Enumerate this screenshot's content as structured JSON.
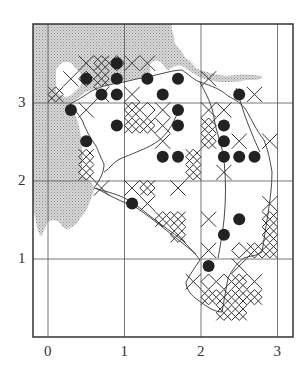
{
  "figure": {
    "type": "distribution-grid-map",
    "frame": {
      "left": 33,
      "top": 24,
      "right": 293,
      "bottom": 337
    },
    "unit_px": {
      "x": 76.5,
      "y": 78
    },
    "origin_px": {
      "x": 48,
      "y": 337
    },
    "subgrid": {
      "cols_per_unit": 5,
      "x0": 55.6,
      "dx": 15.3,
      "y0": 32,
      "dy": 15.6
    },
    "colors": {
      "ink": "#222222",
      "shade": "#c8c8c8",
      "frame": "#333333",
      "grid": "#555555"
    },
    "x_axis": {
      "ticks": [
        {
          "value": 0,
          "label": "0"
        },
        {
          "value": 1,
          "label": "1"
        },
        {
          "value": 2,
          "label": "2"
        },
        {
          "value": 3,
          "label": "3"
        }
      ]
    },
    "y_axis": {
      "ticks": [
        {
          "value": 1,
          "label": "1"
        },
        {
          "value": 2,
          "label": "2"
        },
        {
          "value": 3,
          "label": "3"
        }
      ]
    },
    "legend": {
      "dot": "filled circle — record",
      "x": "cross — record",
      "d": "diamond hatch — record"
    },
    "dots": [
      [
        4,
        2
      ],
      [
        2,
        3
      ],
      [
        4,
        3
      ],
      [
        6,
        3
      ],
      [
        8,
        3
      ],
      [
        3,
        4
      ],
      [
        4,
        4
      ],
      [
        7,
        4
      ],
      [
        12,
        4
      ],
      [
        1,
        5
      ],
      [
        8,
        5
      ],
      [
        4,
        6
      ],
      [
        8,
        6
      ],
      [
        11,
        6
      ],
      [
        2,
        7
      ],
      [
        11,
        7
      ],
      [
        7,
        8
      ],
      [
        8,
        8
      ],
      [
        11,
        8
      ],
      [
        12,
        8
      ],
      [
        13,
        8
      ],
      [
        5,
        11
      ],
      [
        12,
        12
      ],
      [
        11,
        13
      ],
      [
        10,
        15
      ]
    ],
    "crosses": [
      [
        2,
        2
      ],
      [
        3,
        2
      ],
      [
        5,
        2
      ],
      [
        6,
        2
      ],
      [
        3,
        3
      ],
      [
        1,
        3
      ],
      [
        0,
        4
      ],
      [
        3,
        4
      ],
      [
        5,
        4
      ],
      [
        10,
        3
      ],
      [
        13,
        4
      ],
      [
        2,
        5
      ],
      [
        5,
        5
      ],
      [
        7,
        5
      ],
      [
        10,
        5
      ],
      [
        11,
        5
      ],
      [
        5,
        6
      ],
      [
        6,
        6
      ],
      [
        7,
        6
      ],
      [
        10,
        6
      ],
      [
        12,
        7
      ],
      [
        14,
        7
      ],
      [
        10,
        7
      ],
      [
        7,
        7
      ],
      [
        9,
        8
      ],
      [
        2,
        8
      ],
      [
        2,
        9
      ],
      [
        3,
        10
      ],
      [
        9,
        9
      ],
      [
        11,
        9
      ],
      [
        5,
        10
      ],
      [
        6,
        10
      ],
      [
        8,
        10
      ],
      [
        6,
        11
      ],
      [
        7,
        12
      ],
      [
        8,
        12
      ],
      [
        8,
        13
      ],
      [
        10,
        12
      ],
      [
        14,
        11
      ],
      [
        14,
        13
      ],
      [
        10,
        14
      ],
      [
        14,
        14
      ],
      [
        13,
        14
      ],
      [
        12,
        15
      ],
      [
        9,
        16
      ],
      [
        12,
        16
      ],
      [
        13,
        16
      ],
      [
        11,
        17
      ],
      [
        12,
        17
      ],
      [
        11,
        18
      ],
      [
        12,
        18
      ],
      [
        10,
        17
      ],
      [
        13,
        17
      ],
      [
        14,
        12
      ]
    ],
    "diamonds": [
      [
        3,
        2
      ],
      [
        4,
        2
      ],
      [
        2,
        3
      ],
      [
        3,
        3
      ],
      [
        0,
        4
      ],
      [
        5,
        5
      ],
      [
        5,
        6
      ],
      [
        6,
        6
      ],
      [
        6,
        5
      ],
      [
        10,
        6
      ],
      [
        10,
        7
      ],
      [
        9,
        8
      ],
      [
        9,
        9
      ],
      [
        2,
        9
      ],
      [
        2,
        8
      ],
      [
        6,
        10
      ],
      [
        7,
        12
      ],
      [
        8,
        12
      ],
      [
        8,
        13
      ],
      [
        13,
        14
      ],
      [
        14,
        14
      ],
      [
        12,
        14
      ],
      [
        14,
        13
      ],
      [
        14,
        12
      ],
      [
        10,
        16
      ],
      [
        11,
        16
      ],
      [
        11,
        17
      ],
      [
        12,
        17
      ],
      [
        10,
        17
      ],
      [
        12,
        16
      ],
      [
        13,
        17
      ],
      [
        11,
        18
      ],
      [
        12,
        18
      ]
    ]
  }
}
